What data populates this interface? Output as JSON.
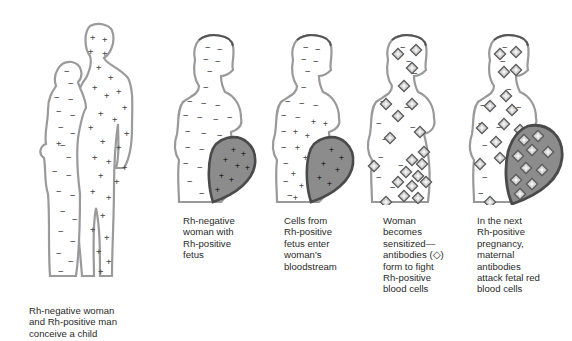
{
  "diagram": {
    "legend": {
      "minus_symbol": "−",
      "plus_symbol": "+",
      "antibody_symbol": "◇",
      "minus_meaning": "Rh-negative",
      "plus_meaning": "Rh-positive"
    },
    "colors": {
      "outline": "#9a9a9a",
      "outline_dark": "#555555",
      "uterus_fill": "#8c8c8c",
      "uterus_outline": "#4a4a4a",
      "text": "#2a2a2a"
    },
    "panels": [
      {
        "id": 1,
        "caption": "Rh-negative woman\nand Rh-positive man\nconceive a child"
      },
      {
        "id": 2,
        "caption": "Rh-negative\nwoman with\nRh-positive\nfetus"
      },
      {
        "id": 3,
        "caption": "Cells from\nRh-positive\nfetus enter\nwoman's\nbloodstream"
      },
      {
        "id": 4,
        "caption": "Woman\nbecomes\nsensitized—\nantibodies (◇)\nform to fight\nRh-positive\nblood cells"
      },
      {
        "id": 5,
        "caption": "In the next\nRh-positive\npregnancy,\nmaternal\nantibodies\nattack fetal red\nblood cells"
      }
    ]
  }
}
